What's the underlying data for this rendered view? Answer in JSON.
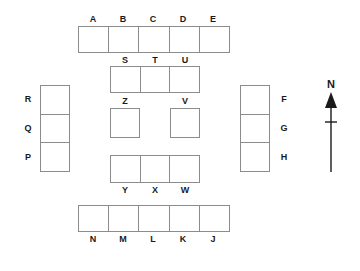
{
  "diagram": {
    "stroke_color": "#8c8c8c",
    "fill_color": "#ffffff",
    "label_color": "#1a1a1a",
    "groups": [
      {
        "id": "top-row",
        "orientation": "horizontal",
        "cell_count": 5,
        "labels_position": "above",
        "labels": [
          "A",
          "B",
          "C",
          "D",
          "E"
        ]
      },
      {
        "id": "upper-middle-row",
        "orientation": "horizontal",
        "cell_count": 3,
        "labels_position": "above",
        "labels": [
          "S",
          "T",
          "U"
        ]
      },
      {
        "id": "center-squares",
        "orientation": "separate",
        "cell_count": 2,
        "labels_position": "above",
        "labels": [
          "Z",
          "V"
        ]
      },
      {
        "id": "lower-middle-row",
        "orientation": "horizontal",
        "cell_count": 3,
        "labels_position": "below",
        "labels": [
          "Y",
          "X",
          "W"
        ]
      },
      {
        "id": "bottom-row",
        "orientation": "horizontal",
        "cell_count": 5,
        "labels_position": "below",
        "labels": [
          "N",
          "M",
          "L",
          "K",
          "J"
        ]
      },
      {
        "id": "left-column",
        "orientation": "vertical",
        "cell_count": 3,
        "labels_position": "left",
        "labels": [
          "R",
          "Q",
          "P"
        ]
      },
      {
        "id": "right-column",
        "orientation": "vertical",
        "cell_count": 3,
        "labels_position": "right",
        "labels": [
          "F",
          "G",
          "H"
        ]
      }
    ]
  },
  "compass": {
    "label": "N",
    "direction": "north",
    "icon": "north-arrow-icon"
  }
}
